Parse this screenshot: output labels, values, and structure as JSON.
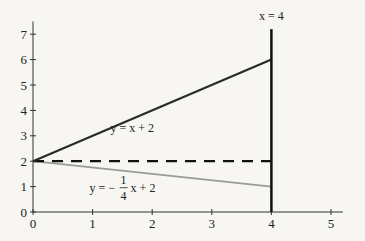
{
  "chart_data": {
    "type": "line",
    "title": "",
    "xlabel": "",
    "ylabel": "",
    "xlim": [
      0,
      5.2
    ],
    "ylim": [
      0,
      7.5
    ],
    "x_ticks": [
      0,
      1,
      2,
      3,
      4,
      5
    ],
    "y_ticks": [
      0,
      1,
      2,
      3,
      4,
      5,
      6,
      7
    ],
    "grid": false,
    "series": [
      {
        "name": "y = x + 2",
        "style": "solid",
        "color": "#2a2a2a",
        "x": [
          0,
          4
        ],
        "y": [
          2,
          6
        ]
      },
      {
        "name": "y = -1/4 x + 2",
        "style": "solid",
        "color": "#9a9a9a",
        "x": [
          0,
          4
        ],
        "y": [
          2,
          1
        ]
      },
      {
        "name": "y = 2",
        "style": "dashed",
        "color": "#111111",
        "x": [
          0,
          4
        ],
        "y": [
          2,
          2
        ]
      },
      {
        "name": "x = 4",
        "style": "solid",
        "color": "#111111",
        "x": [
          4,
          4
        ],
        "y": [
          0,
          7.2
        ]
      }
    ],
    "annotations": [
      {
        "id": "line1",
        "text": "y = x + 2",
        "x": 1.3,
        "y": 3.15
      },
      {
        "id": "line2_prefix",
        "text": "y = −",
        "x": 0.95,
        "y": 0.8
      },
      {
        "id": "line2_num",
        "text": "1"
      },
      {
        "id": "line2_den",
        "text": "4"
      },
      {
        "id": "line2_suffix",
        "text": "x + 2"
      },
      {
        "id": "vline",
        "text": "x = 4",
        "x": 4,
        "y": 7.55
      }
    ]
  }
}
